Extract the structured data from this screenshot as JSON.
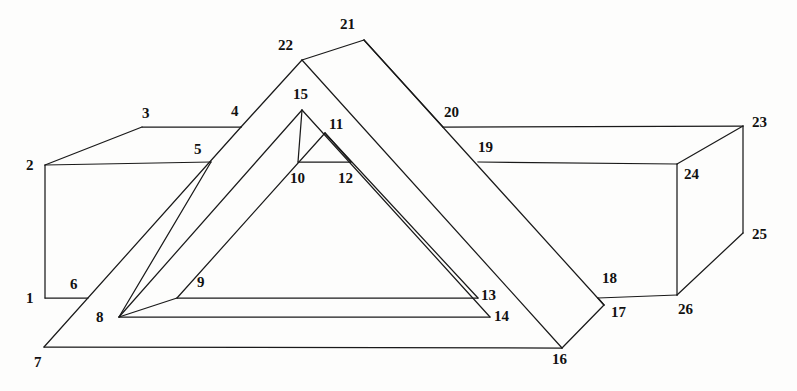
{
  "figure": {
    "background_color": "#fdfdfc",
    "stroke_color": "#1a1a1a",
    "label_color": "#111111",
    "width": 797,
    "height": 391
  },
  "labels": [
    {
      "id": "1",
      "text": "1",
      "x": 26,
      "y": 291
    },
    {
      "id": "2",
      "text": "2",
      "x": 26,
      "y": 158
    },
    {
      "id": "3",
      "text": "3",
      "x": 142,
      "y": 106
    },
    {
      "id": "4",
      "text": "4",
      "x": 231,
      "y": 104
    },
    {
      "id": "5",
      "text": "5",
      "x": 194,
      "y": 142
    },
    {
      "id": "6",
      "text": "6",
      "x": 70,
      "y": 277
    },
    {
      "id": "7",
      "text": "7",
      "x": 34,
      "y": 355
    },
    {
      "id": "8",
      "text": "8",
      "x": 96,
      "y": 310
    },
    {
      "id": "9",
      "text": "9",
      "x": 197,
      "y": 275
    },
    {
      "id": "10",
      "text": "10",
      "x": 290,
      "y": 171
    },
    {
      "id": "11",
      "text": "11",
      "x": 329,
      "y": 117
    },
    {
      "id": "12",
      "text": "12",
      "x": 338,
      "y": 171
    },
    {
      "id": "13",
      "text": "13",
      "x": 481,
      "y": 288
    },
    {
      "id": "14",
      "text": "14",
      "x": 494,
      "y": 309
    },
    {
      "id": "15",
      "text": "15",
      "x": 293,
      "y": 87
    },
    {
      "id": "16",
      "text": "16",
      "x": 552,
      "y": 352
    },
    {
      "id": "17",
      "text": "17",
      "x": 611,
      "y": 305
    },
    {
      "id": "18",
      "text": "18",
      "x": 602,
      "y": 271
    },
    {
      "id": "19",
      "text": "19",
      "x": 478,
      "y": 140
    },
    {
      "id": "20",
      "text": "20",
      "x": 444,
      "y": 105
    },
    {
      "id": "21",
      "text": "21",
      "x": 340,
      "y": 17
    },
    {
      "id": "22",
      "text": "22",
      "x": 278,
      "y": 38
    },
    {
      "id": "23",
      "text": "23",
      "x": 752,
      "y": 115
    },
    {
      "id": "24",
      "text": "24",
      "x": 684,
      "y": 167
    },
    {
      "id": "25",
      "text": "25",
      "x": 752,
      "y": 227
    },
    {
      "id": "26",
      "text": "26",
      "x": 678,
      "y": 302
    }
  ],
  "vertices": {
    "v1": {
      "x": 45,
      "y": 298
    },
    "v2": {
      "x": 45,
      "y": 165
    },
    "v3": {
      "x": 142,
      "y": 127
    },
    "v4": {
      "x": 241,
      "y": 127
    },
    "v5": {
      "x": 211,
      "y": 162
    },
    "v6": {
      "x": 88,
      "y": 298
    },
    "v7": {
      "x": 44,
      "y": 347
    },
    "v8": {
      "x": 119,
      "y": 317
    },
    "v9": {
      "x": 177,
      "y": 298
    },
    "v10": {
      "x": 298,
      "y": 162
    },
    "v11": {
      "x": 325,
      "y": 133
    },
    "v12": {
      "x": 351,
      "y": 162
    },
    "v13": {
      "x": 478,
      "y": 298
    },
    "v14": {
      "x": 490,
      "y": 317
    },
    "v15": {
      "x": 302,
      "y": 110
    },
    "v16": {
      "x": 562,
      "y": 348
    },
    "v17": {
      "x": 604,
      "y": 305
    },
    "v18": {
      "x": 598,
      "y": 298
    },
    "v19": {
      "x": 478,
      "y": 162
    },
    "v20": {
      "x": 443,
      "y": 127
    },
    "v21": {
      "x": 364,
      "y": 40
    },
    "v22": {
      "x": 302,
      "y": 60
    },
    "v23": {
      "x": 743,
      "y": 126
    },
    "v24": {
      "x": 677,
      "y": 164
    },
    "v25": {
      "x": 743,
      "y": 233
    },
    "v26": {
      "x": 677,
      "y": 295
    }
  },
  "edges": [
    {
      "name": "edge-box-left-vertical-1-2",
      "d": "M45,298 L45,165"
    },
    {
      "name": "edge-box-top-left-2-3",
      "d": "M45,165 L142,127"
    },
    {
      "name": "edge-box-top-3-4",
      "d": "M142,127 L241,127"
    },
    {
      "name": "edge-box-front-top-2-5",
      "d": "M45,165 L211,162"
    },
    {
      "name": "edge-box-bottom-left-1-6",
      "d": "M45,298 L88,298"
    },
    {
      "name": "edge-slab-left-upper-4-22",
      "d": "M241,127 L302,60"
    },
    {
      "name": "edge-slab-left-lower-5-8",
      "d": "M211,162 L119,317"
    },
    {
      "name": "edge-ramp-7-4",
      "d": "M44,347 L241,127"
    },
    {
      "name": "edge-base-bottom-7-16",
      "d": "M44,347 L562,348"
    },
    {
      "name": "edge-inner-fan-8-9",
      "d": "M119,317 L177,298"
    },
    {
      "name": "edge-inner-long-9-13",
      "d": "M177,298 L478,298"
    },
    {
      "name": "edge-inner-long-8-14",
      "d": "M119,317 L490,317"
    },
    {
      "name": "edge-tri-left-outer-8-15",
      "d": "M119,317 L302,110"
    },
    {
      "name": "edge-tri-left-inner-9-11",
      "d": "M177,298 L325,133"
    },
    {
      "name": "edge-tri-apex-15-right-14",
      "d": "M302,110 L490,317"
    },
    {
      "name": "edge-tri-inner-apex-11-13",
      "d": "M325,133 L478,298"
    },
    {
      "name": "edge-inner-small-10-12",
      "d": "M298,162 L351,162"
    },
    {
      "name": "edge-inner-small-15-10",
      "d": "M302,110 L298,162"
    },
    {
      "name": "edge-inner-small-11-12",
      "d": "M325,133 L351,162"
    },
    {
      "name": "edge-beam-top-22-21",
      "d": "M302,60 L364,40"
    },
    {
      "name": "edge-beam-left-22-16",
      "d": "M302,60 L562,348"
    },
    {
      "name": "edge-beam-right-21-17",
      "d": "M364,40 L604,305"
    },
    {
      "name": "edge-beam-bottom-16-17",
      "d": "M562,348 L604,305"
    },
    {
      "name": "edge-beam-fold-20-21",
      "d": "M443,127 L364,40"
    },
    {
      "name": "edge-rightbox-top-20-23",
      "d": "M443,127 L743,126"
    },
    {
      "name": "edge-rightbox-front-19-24",
      "d": "M478,162 L677,164"
    },
    {
      "name": "edge-rightbox-right-top-23-24",
      "d": "M743,126 L677,164"
    },
    {
      "name": "edge-rightbox-right-vert-23-25",
      "d": "M743,126 L743,233"
    },
    {
      "name": "edge-rightbox-face-vert-24-26",
      "d": "M677,164 L677,295"
    },
    {
      "name": "edge-rightbox-bottom-18-26",
      "d": "M598,298 L677,295"
    },
    {
      "name": "edge-rightbox-corner-25-26",
      "d": "M743,233 L677,295"
    },
    {
      "name": "edge-joint-17-18",
      "d": "M604,305 L598,298"
    }
  ]
}
